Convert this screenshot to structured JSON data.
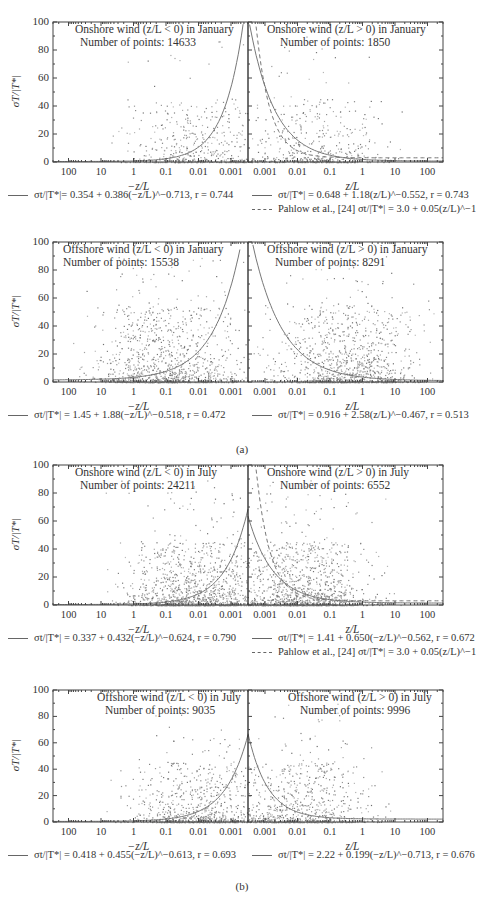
{
  "figure": {
    "caption_a": "(a)",
    "caption_b": "(b)",
    "ylabel": "σT/|T*|",
    "xlabel_left": "−z/L",
    "xlabel_right": "z/L",
    "yticks": [
      "100",
      "80",
      "60",
      "40",
      "20",
      "0"
    ],
    "xticks_left": [
      "100",
      "10",
      "1",
      "0.1",
      "0.01",
      "0.001"
    ],
    "xticks_right": [
      "0.001",
      "0.01",
      "0.1",
      "1",
      "10",
      "100"
    ]
  },
  "panels": [
    {
      "left_title": "Onshore wind (z/L < 0) in January",
      "left_count": "Number of points: 14633",
      "right_title": "Onshore wind (z/L > 0) in January",
      "right_count": "Number of points: 1850",
      "legend_left": "σt/|T*|= 0.354 + 0.386(−z/L)^−0.713, r = 0.744",
      "legend_right": "σt/|T*| = 0.648 + 1.18(z/L)^−0.552, r = 0.743",
      "legend_pahlow": "Pahlow et al., [24] σt/|T*| = 3.0 + 0.05(z/L)^−1"
    },
    {
      "left_title": "Offshore wind (z/L < 0) in January",
      "left_count": "Number of points: 15538",
      "right_title": "Offshore wind (z/L > 0) in January",
      "right_count": "Number of points: 8291",
      "legend_left": "σt/|T*| = 1.45 + 1.88(−z/L)^−0.518, r = 0.472",
      "legend_right": "σt/|T*| = 0.916 + 2.58(z/L)^−0.467, r = 0.513"
    },
    {
      "left_title": "Onshore wind (z/L < 0) in July",
      "left_count": "Number of points: 24211",
      "right_title": "Onshore wind (z/L > 0) in July",
      "right_count": "Number of points: 6552",
      "legend_left": "σt/|T*| = 0.337 + 0.432(−z/L)^−0.624, r = 0.790",
      "legend_right": "σt/|T*| = 1.41 + 0.650(−z/L)^−0.562, r = 0.672",
      "legend_pahlow": "Pahlow et al., [24] σt/|T*| = 3.0 + 0.05(z/L)^−1"
    },
    {
      "left_title": "Offshore wind (z/L < 0) in July",
      "left_count": "Number of points: 9035",
      "right_title": "Offshore wind (z/L > 0) in July",
      "right_count": "Number of points: 9996",
      "legend_left": "σt/|T*| = 0.418 + 0.455(−z/L)^−0.613, r = 0.693",
      "legend_right": "σt/|T*| = 2.22 + 0.199(−z/L)^−0.713, r = 0.676"
    }
  ],
  "chart_data": [
    {
      "type": "scatter",
      "title": "Onshore wind (z/L < 0) in January",
      "n_points": 14633,
      "xlabel": "−z/L",
      "ylabel": "σT/|T*|",
      "xscale": "log",
      "xlim": [
        300,
        0.0003
      ],
      "ylim": [
        0,
        100
      ],
      "xticks": [
        100,
        10,
        1,
        0.1,
        0.01,
        0.001
      ],
      "yticks": [
        0,
        20,
        40,
        60,
        80,
        100
      ],
      "fit": {
        "a": 0.354,
        "b": 0.386,
        "c": -0.713,
        "r": 0.744
      }
    },
    {
      "type": "scatter",
      "title": "Onshore wind (z/L > 0) in January",
      "n_points": 1850,
      "xlabel": "z/L",
      "ylabel": "σT/|T*|",
      "xscale": "log",
      "xlim": [
        0.0003,
        300
      ],
      "ylim": [
        0,
        100
      ],
      "xticks": [
        0.001,
        0.01,
        0.1,
        1,
        10,
        100
      ],
      "yticks": [
        0,
        20,
        40,
        60,
        80,
        100
      ],
      "fit": {
        "a": 0.648,
        "b": 1.18,
        "c": -0.552,
        "r": 0.743
      },
      "reference": {
        "name": "Pahlow et al. [24]",
        "a": 3.0,
        "b": 0.05,
        "c": -1
      }
    },
    {
      "type": "scatter",
      "title": "Offshore wind (z/L < 0) in January",
      "n_points": 15538,
      "xlabel": "−z/L",
      "ylabel": "σT/|T*|",
      "xscale": "log",
      "xlim": [
        300,
        0.0003
      ],
      "ylim": [
        0,
        100
      ],
      "fit": {
        "a": 1.45,
        "b": 1.88,
        "c": -0.518,
        "r": 0.472
      }
    },
    {
      "type": "scatter",
      "title": "Offshore wind (z/L > 0) in January",
      "n_points": 8291,
      "xlabel": "z/L",
      "ylabel": "σT/|T*|",
      "xscale": "log",
      "xlim": [
        0.0003,
        300
      ],
      "ylim": [
        0,
        100
      ],
      "fit": {
        "a": 0.916,
        "b": 2.58,
        "c": -0.467,
        "r": 0.513
      }
    },
    {
      "type": "scatter",
      "title": "Onshore wind (z/L < 0) in July",
      "n_points": 24211,
      "xlabel": "−z/L",
      "ylabel": "σT/|T*|",
      "xscale": "log",
      "xlim": [
        300,
        0.0003
      ],
      "ylim": [
        0,
        100
      ],
      "fit": {
        "a": 0.337,
        "b": 0.432,
        "c": -0.624,
        "r": 0.79
      }
    },
    {
      "type": "scatter",
      "title": "Onshore wind (z/L > 0) in July",
      "n_points": 6552,
      "xlabel": "z/L",
      "ylabel": "σT/|T*|",
      "xscale": "log",
      "xlim": [
        0.0003,
        300
      ],
      "ylim": [
        0,
        100
      ],
      "fit": {
        "a": 1.41,
        "b": 0.65,
        "c": -0.562,
        "r": 0.672
      },
      "reference": {
        "name": "Pahlow et al. [24]",
        "a": 3.0,
        "b": 0.05,
        "c": -1
      }
    },
    {
      "type": "scatter",
      "title": "Offshore wind (z/L < 0) in July",
      "n_points": 9035,
      "xlabel": "−z/L",
      "ylabel": "σT/|T*|",
      "xscale": "log",
      "xlim": [
        300,
        0.0003
      ],
      "ylim": [
        0,
        100
      ],
      "fit": {
        "a": 0.418,
        "b": 0.455,
        "c": -0.613,
        "r": 0.693
      }
    },
    {
      "type": "scatter",
      "title": "Offshore wind (z/L > 0) in July",
      "n_points": 9996,
      "xlabel": "z/L",
      "ylabel": "σT/|T*|",
      "xscale": "log",
      "xlim": [
        0.0003,
        300
      ],
      "ylim": [
        0,
        100
      ],
      "fit": {
        "a": 2.22,
        "b": 0.199,
        "c": -0.713,
        "r": 0.676
      }
    }
  ]
}
